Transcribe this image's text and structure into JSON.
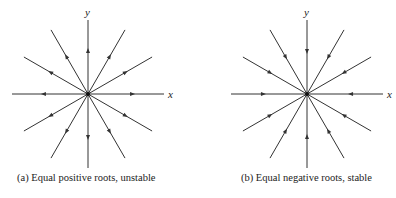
{
  "panels": [
    {
      "id": "a",
      "caption": "(a) Equal positive roots, unstable",
      "x_label": "x",
      "y_label": "y",
      "center": [
        88,
        94
      ],
      "direction": "outward",
      "caption_left": 17
    },
    {
      "id": "b",
      "caption": "(b) Equal negative roots, stable",
      "x_label": "x",
      "y_label": "y",
      "center": [
        307,
        94
      ],
      "direction": "inward",
      "caption_left": 241
    }
  ],
  "style": {
    "line_color": "#333333",
    "background": "#ffffff"
  }
}
